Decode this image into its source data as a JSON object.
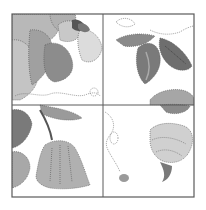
{
  "image": {
    "subject": "quilt block pattern - four-patch floral applique",
    "blocks": [
      {
        "position": "top-left",
        "content": "large flower with petals and dark center"
      },
      {
        "position": "top-right",
        "content": "leaves on stem"
      },
      {
        "position": "bottom-left",
        "content": "leaves and tulip-like bud"
      },
      {
        "position": "bottom-right",
        "content": "ruffled flower bud and small seed"
      }
    ],
    "colors": {
      "background": "#ffffff",
      "frame": "#5a5a5a",
      "light_fill": "#c9c9c9",
      "mid_fill": "#a8a8a8",
      "dark_fill": "#7d7d7d",
      "darkest": "#4a4a4a",
      "stitch": "#555555"
    }
  }
}
